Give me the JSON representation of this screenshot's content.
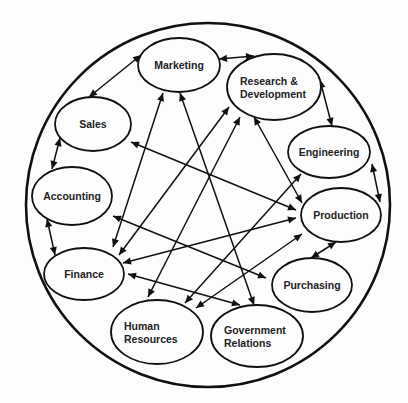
{
  "diagram": {
    "type": "organizational-interdependence-network",
    "nodes": [
      {
        "id": "marketing",
        "label_lines": [
          "Marketing"
        ]
      },
      {
        "id": "rnd",
        "label_lines": [
          "Research &",
          "Development"
        ]
      },
      {
        "id": "sales",
        "label_lines": [
          "Sales"
        ]
      },
      {
        "id": "engineering",
        "label_lines": [
          "Engineering"
        ]
      },
      {
        "id": "accounting",
        "label_lines": [
          "Accounting"
        ]
      },
      {
        "id": "production",
        "label_lines": [
          "Production"
        ]
      },
      {
        "id": "finance",
        "label_lines": [
          "Finance"
        ]
      },
      {
        "id": "purchasing",
        "label_lines": [
          "Purchasing"
        ]
      },
      {
        "id": "hr",
        "label_lines": [
          "Human",
          "Resources"
        ]
      },
      {
        "id": "govrel",
        "label_lines": [
          "Government",
          "Relations"
        ]
      }
    ],
    "edges": [
      {
        "from": "marketing",
        "to": "sales",
        "direction": "both"
      },
      {
        "from": "marketing",
        "to": "rnd",
        "direction": "both"
      },
      {
        "from": "marketing",
        "to": "finance",
        "direction": "both"
      },
      {
        "from": "marketing",
        "to": "govrel",
        "direction": "both"
      },
      {
        "from": "rnd",
        "to": "engineering",
        "direction": "both"
      },
      {
        "from": "rnd",
        "to": "finance",
        "direction": "both"
      },
      {
        "from": "rnd",
        "to": "hr",
        "direction": "both"
      },
      {
        "from": "rnd",
        "to": "production",
        "direction": "both"
      },
      {
        "from": "sales",
        "to": "accounting",
        "direction": "both"
      },
      {
        "from": "sales",
        "to": "production",
        "direction": "both"
      },
      {
        "from": "accounting",
        "to": "finance",
        "direction": "both"
      },
      {
        "from": "accounting",
        "to": "purchasing",
        "direction": "both"
      },
      {
        "from": "engineering",
        "to": "production",
        "direction": "both"
      },
      {
        "from": "engineering",
        "to": "hr",
        "direction": "both"
      },
      {
        "from": "production",
        "to": "purchasing",
        "direction": "both"
      },
      {
        "from": "production",
        "to": "finance",
        "direction": "both"
      },
      {
        "from": "production",
        "to": "hr",
        "direction": "both"
      },
      {
        "from": "finance",
        "to": "govrel",
        "direction": "both"
      }
    ]
  }
}
